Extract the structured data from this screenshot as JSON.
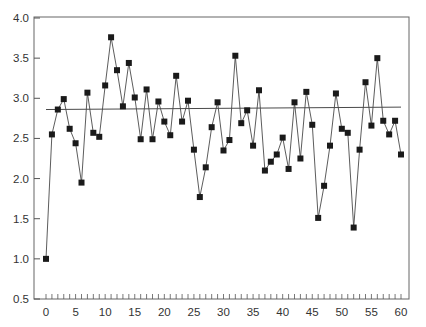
{
  "chart_data": {
    "type": "line",
    "title": "",
    "xlabel": "",
    "ylabel": "",
    "xlim": [
      0,
      60
    ],
    "ylim": [
      0.5,
      4.0
    ],
    "grid": false,
    "legend": null,
    "x_ticks": [
      0,
      5,
      10,
      15,
      20,
      25,
      30,
      35,
      40,
      45,
      50,
      55,
      60
    ],
    "x_tick_labels": [
      "0",
      "5",
      "10",
      "15",
      "20",
      "25",
      "30",
      "35",
      "40",
      "45",
      "50",
      "55",
      "60"
    ],
    "y_ticks": [
      0.5,
      1.0,
      1.5,
      2.0,
      2.5,
      3.0,
      3.5,
      4.0
    ],
    "y_tick_labels": [
      "0.5",
      "1.0",
      "1.5",
      "2.0",
      "2.5",
      "3.0",
      "3.5",
      "4.0"
    ],
    "minor_x_ticks_every": 1,
    "marker": "square",
    "series": [
      {
        "name": "observations",
        "x": [
          0,
          1,
          2,
          3,
          4,
          5,
          6,
          7,
          8,
          9,
          10,
          11,
          12,
          13,
          14,
          15,
          16,
          17,
          18,
          19,
          20,
          21,
          22,
          23,
          24,
          25,
          26,
          27,
          28,
          29,
          30,
          31,
          32,
          33,
          34,
          35,
          36,
          37,
          38,
          39,
          40,
          41,
          42,
          43,
          44,
          45,
          46,
          47,
          48,
          49,
          50,
          51,
          52,
          53,
          54,
          55,
          56,
          57,
          58,
          59,
          60
        ],
        "values": [
          1.0,
          2.55,
          2.86,
          2.99,
          2.62,
          2.44,
          1.95,
          3.07,
          2.57,
          2.52,
          3.16,
          3.76,
          3.35,
          2.9,
          3.44,
          3.01,
          2.49,
          3.11,
          2.49,
          2.96,
          2.71,
          2.54,
          3.28,
          2.71,
          2.97,
          2.36,
          1.77,
          2.14,
          2.64,
          2.95,
          2.35,
          2.48,
          3.53,
          2.69,
          2.85,
          2.41,
          3.1,
          2.1,
          2.21,
          2.3,
          2.51,
          2.12,
          2.95,
          2.25,
          3.08,
          2.67,
          1.51,
          1.91,
          2.41,
          3.06,
          2.62,
          2.57,
          1.39,
          2.36,
          3.2,
          2.66,
          3.5,
          2.72,
          2.55,
          2.72,
          2.3
        ]
      }
    ],
    "reference_line": {
      "name": "trend-line",
      "x": [
        0,
        60
      ],
      "y": [
        2.86,
        2.89
      ]
    }
  },
  "colors": {
    "line": "#4a4a4a",
    "marker": "#1a1a1a",
    "axis": "#555555",
    "text": "#333333"
  }
}
